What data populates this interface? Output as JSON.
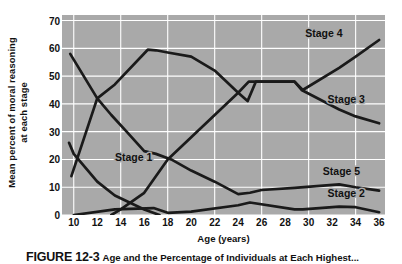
{
  "figure": {
    "caption_number": "FIGURE 12-3",
    "caption_text": "Age and the Percentage of Individuals at Each Highest..."
  },
  "chart_data": {
    "type": "line",
    "title": "",
    "xlabel": "Age (years)",
    "ylabel_line1": "Mean percent of moral reasoning",
    "ylabel_line2": "at each stage",
    "xlim": [
      9,
      36.5
    ],
    "ylim": [
      0,
      72
    ],
    "xticks": [
      10,
      12,
      14,
      16,
      18,
      20,
      22,
      24,
      26,
      28,
      30,
      32,
      34,
      36
    ],
    "yticks": [
      0,
      10,
      20,
      30,
      40,
      50,
      60,
      70
    ],
    "grid": true,
    "legend": "inline-labels",
    "plot_bg": "#a9a9a9",
    "grid_color": "#ffffff",
    "line_color": "#1a1a1a",
    "series": [
      {
        "name": "Stage 1",
        "label": "Stage 1",
        "label_x": 15.1,
        "label_y": 19.5,
        "x": [
          9.6,
          10,
          12,
          13.5,
          16,
          17.3
        ],
        "values": [
          26,
          22,
          12,
          7,
          2,
          0
        ]
      },
      {
        "name": "Stage 2",
        "label": "Stage 2",
        "label_x": 33.2,
        "label_y": 6.5,
        "x": [
          10,
          12,
          13.5,
          16.8,
          18,
          20,
          24,
          25,
          28.8,
          29.5,
          32.6,
          34,
          36
        ],
        "values": [
          58,
          42,
          47,
          57.5,
          59.5,
          57,
          41,
          48,
          48,
          45,
          38,
          35.5,
          33
        ]
      },
      {
        "name": "Stage 3",
        "label": "Stage 3",
        "label_x": 33.2,
        "label_y": 40.5,
        "x": [
          10,
          12,
          13.5,
          16.8,
          18,
          20,
          24,
          25,
          28.8,
          29.5,
          32.6,
          34,
          36
        ],
        "values": [
          58,
          42,
          47,
          57.5,
          59.5,
          57,
          41,
          48,
          48,
          45,
          38,
          35.5,
          33
        ]
      },
      {
        "name": "Stage 4",
        "label": "Stage 4",
        "label_x": 31.3,
        "label_y": 64,
        "x": [
          13.5,
          16.8,
          18,
          20,
          24,
          25,
          28.8,
          29.5,
          32.6,
          36
        ],
        "values": [
          0,
          8,
          20,
          28,
          44,
          48,
          48,
          45,
          53,
          63
        ]
      },
      {
        "name": "Stage 5",
        "label": "Stage 5",
        "label_x": 32.8,
        "label_y": 14.5,
        "x": [
          13.5,
          18,
          20,
          24,
          25,
          28.8,
          32.6,
          34,
          36
        ],
        "values": [
          0,
          1,
          2,
          7,
          9,
          9.5,
          11,
          10,
          9
        ]
      }
    ],
    "drawn_paths": [
      {
        "name": "Stage1-descending",
        "points": [
          [
            9.6,
            26
          ],
          [
            10,
            22
          ],
          [
            12,
            12
          ],
          [
            13.5,
            7
          ],
          [
            16,
            2
          ],
          [
            17.3,
            0
          ]
        ]
      },
      {
        "name": "Stage3-curve",
        "points": [
          [
            9.7,
            58
          ],
          [
            12,
            42
          ],
          [
            13.2,
            36
          ],
          [
            14.5,
            30
          ],
          [
            16,
            23
          ],
          [
            17,
            22
          ],
          [
            18.3,
            20
          ],
          [
            20,
            16
          ],
          [
            22,
            12
          ],
          [
            24,
            7.5
          ],
          [
            25,
            8
          ],
          [
            26,
            9
          ],
          [
            28.8,
            9.8
          ],
          [
            29.6,
            10
          ],
          [
            32.6,
            11
          ],
          [
            34,
            10
          ],
          [
            36,
            8.8
          ]
        ]
      },
      {
        "name": "Stage2-low",
        "points": [
          [
            10,
            0
          ],
          [
            13.5,
            2
          ],
          [
            16.8,
            2.5
          ],
          [
            18,
            0.8
          ],
          [
            20,
            1.2
          ],
          [
            24,
            3.5
          ],
          [
            25,
            4.5
          ],
          [
            28.8,
            2
          ],
          [
            29.5,
            2
          ],
          [
            32.6,
            3
          ],
          [
            34,
            2.8
          ],
          [
            36,
            1
          ]
        ]
      },
      {
        "name": "Stage4-rising",
        "points": [
          [
            9.8,
            14
          ],
          [
            12,
            42
          ],
          [
            13.5,
            47
          ],
          [
            16.3,
            59.5
          ],
          [
            17,
            59.3
          ],
          [
            18,
            58.5
          ],
          [
            20,
            57
          ],
          [
            22,
            52
          ],
          [
            24,
            44
          ],
          [
            24.8,
            41
          ],
          [
            25.5,
            48
          ],
          [
            28.8,
            48
          ],
          [
            29.4,
            45
          ],
          [
            32.6,
            38
          ],
          [
            34,
            35.5
          ],
          [
            36,
            33
          ]
        ]
      },
      {
        "name": "Stage5-rising-top",
        "points": [
          [
            13.2,
            0
          ],
          [
            14,
            2
          ],
          [
            16,
            8
          ],
          [
            18,
            20
          ],
          [
            20,
            28
          ],
          [
            22,
            36
          ],
          [
            24,
            44
          ],
          [
            24.9,
            48
          ],
          [
            28.8,
            48
          ],
          [
            29.5,
            45
          ],
          [
            32.6,
            53
          ],
          [
            34,
            57
          ],
          [
            36,
            63
          ]
        ]
      }
    ]
  }
}
